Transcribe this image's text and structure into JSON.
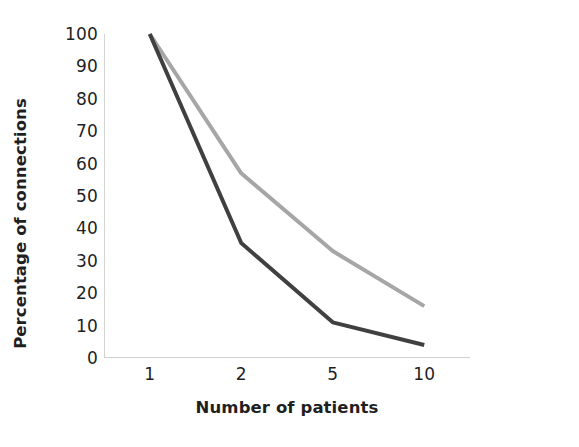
{
  "chart_data": {
    "type": "line",
    "title": "",
    "subtitle": "",
    "xlabel": "Number of patients",
    "ylabel": "Percentage of connections",
    "categories": [
      "1",
      "2",
      "5",
      "10"
    ],
    "x_tick_labels": [
      "1",
      "2",
      "5",
      "10"
    ],
    "y_tick_labels": [
      "0",
      "10",
      "20",
      "30",
      "40",
      "50",
      "60",
      "70",
      "80",
      "90",
      "100"
    ],
    "y_tick_values": [
      0,
      10,
      20,
      30,
      40,
      50,
      60,
      70,
      80,
      90,
      100
    ],
    "ylim": [
      0,
      100
    ],
    "xlim_categorical": true,
    "grid": false,
    "legend": false,
    "legend_position": "none",
    "annotations": [],
    "series": [
      {
        "name": "light-gray-series",
        "color": "#a6a6a6",
        "line_width": 4,
        "values": [
          100,
          57,
          33,
          16
        ]
      },
      {
        "name": "dark-gray-series",
        "color": "#404040",
        "line_width": 4,
        "values": [
          100,
          35.5,
          11,
          4
        ]
      }
    ]
  },
  "axes": {
    "y_axis_line_color": "#d3d3d3",
    "x_axis_line_color": "#d0d0d0"
  }
}
